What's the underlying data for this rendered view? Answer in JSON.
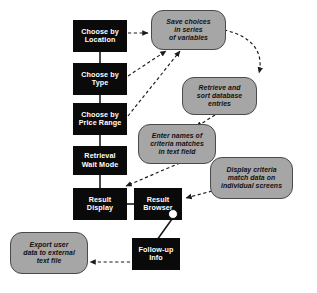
{
  "diagram": {
    "colors": {
      "process_fill": "#0a0a0a",
      "process_text": "#ffffff",
      "note_fill": "#a6a6a6",
      "note_border": "#4a4a4a",
      "note_text": "#111111",
      "background": "#ffffff",
      "connector": "#1a1a1a"
    },
    "process_nodes": [
      {
        "id": "choose-location",
        "label": "Choose by\nLocation",
        "line1": "Choose by",
        "line2": "Location",
        "x": 73,
        "y": 20,
        "w": 54,
        "h": 32
      },
      {
        "id": "choose-type",
        "label": "Choose by\nType",
        "line1": "Choose by",
        "line2": "Type",
        "x": 73,
        "y": 63,
        "w": 54,
        "h": 32
      },
      {
        "id": "choose-price",
        "label": "Choose by\nPrice Range",
        "line1": "Choose by",
        "line2": "Price Range",
        "x": 73,
        "y": 103,
        "w": 54,
        "h": 32
      },
      {
        "id": "retrieval-wait",
        "label": "Retrieval\nWait Mode",
        "line1": "Retrieval",
        "line2": "Wait Mode",
        "x": 73,
        "y": 146,
        "w": 54,
        "h": 29
      },
      {
        "id": "result-display",
        "label": "Result\nDisplay",
        "line1": "Result",
        "line2": "Display",
        "x": 73,
        "y": 188,
        "w": 54,
        "h": 32
      },
      {
        "id": "result-browser",
        "label": "Result\nBrowser",
        "line1": "Result",
        "line2": "Browser",
        "x": 134,
        "y": 188,
        "w": 48,
        "h": 32
      },
      {
        "id": "follow-up-info",
        "label": "Follow-up\nInfo",
        "line1": "Follow-up",
        "line2": "Info",
        "x": 132,
        "y": 238,
        "w": 48,
        "h": 32
      }
    ],
    "note_nodes": [
      {
        "id": "save-choices",
        "line1": "Save choices",
        "line2": "in series",
        "line3": "of variables",
        "x": 151,
        "y": 10,
        "w": 73,
        "h": 38
      },
      {
        "id": "retrieve-sort",
        "line1": "Retrieve and",
        "line2": "sort database",
        "line3": "entries",
        "x": 182,
        "y": 77,
        "w": 73,
        "h": 36
      },
      {
        "id": "enter-names",
        "line1": "Enter names of",
        "line2": "criteria matches",
        "line3": "in text field",
        "x": 138,
        "y": 124,
        "w": 76,
        "h": 38
      },
      {
        "id": "display-criteria",
        "line1": "Display criteria",
        "line2": "match data on",
        "line3": "individual screens",
        "x": 210,
        "y": 157,
        "w": 81,
        "h": 40
      },
      {
        "id": "export-user",
        "line1": "Export user",
        "line2": "data to external",
        "line3": "text file",
        "x": 10,
        "y": 232,
        "w": 76,
        "h": 40
      }
    ],
    "junction": {
      "id": "browser-junction",
      "x": 171,
      "y": 212
    },
    "connectors": [
      {
        "from": "choose-location",
        "to": "choose-type",
        "style": "solid"
      },
      {
        "from": "choose-type",
        "to": "choose-price",
        "style": "solid"
      },
      {
        "from": "choose-price",
        "to": "retrieval-wait",
        "style": "solid"
      },
      {
        "from": "retrieval-wait",
        "to": "result-display",
        "style": "solid"
      },
      {
        "from": "result-display",
        "to": "result-browser",
        "style": "solid"
      },
      {
        "from": "browser-junction",
        "to": "follow-up-info",
        "style": "solid"
      },
      {
        "from": "choose-location",
        "to": "save-choices",
        "style": "dashed-arrow"
      },
      {
        "from": "choose-type",
        "to": "save-choices",
        "style": "dashed-arrow"
      },
      {
        "from": "choose-price",
        "to": "save-choices",
        "style": "dashed-arrow"
      },
      {
        "from": "save-choices",
        "to": "retrieve-sort",
        "style": "dashed-arrow-curved"
      },
      {
        "from": "retrieve-sort",
        "to": "enter-names",
        "style": "dashed-arrow"
      },
      {
        "from": "enter-names",
        "to": "result-display",
        "style": "dashed-arrow"
      },
      {
        "from": "display-criteria",
        "to": "result-browser",
        "style": "dashed-arrow"
      },
      {
        "from": "follow-up-info",
        "to": "export-user",
        "style": "dashed-arrow"
      }
    ]
  }
}
